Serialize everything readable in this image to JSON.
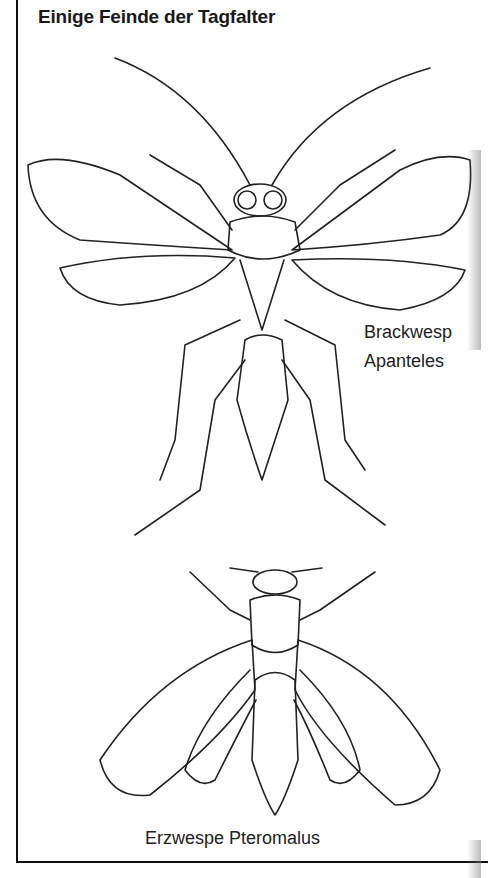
{
  "title": "Einige Feinde der Tagfalter",
  "figures": [
    {
      "name": "Brackwespe Apanteles",
      "label_line1": "Brackwesp",
      "label_line2": "Apanteles"
    },
    {
      "name": "Erzwespe Pteromalus",
      "label": "Erzwespe Pteromalus"
    }
  ]
}
